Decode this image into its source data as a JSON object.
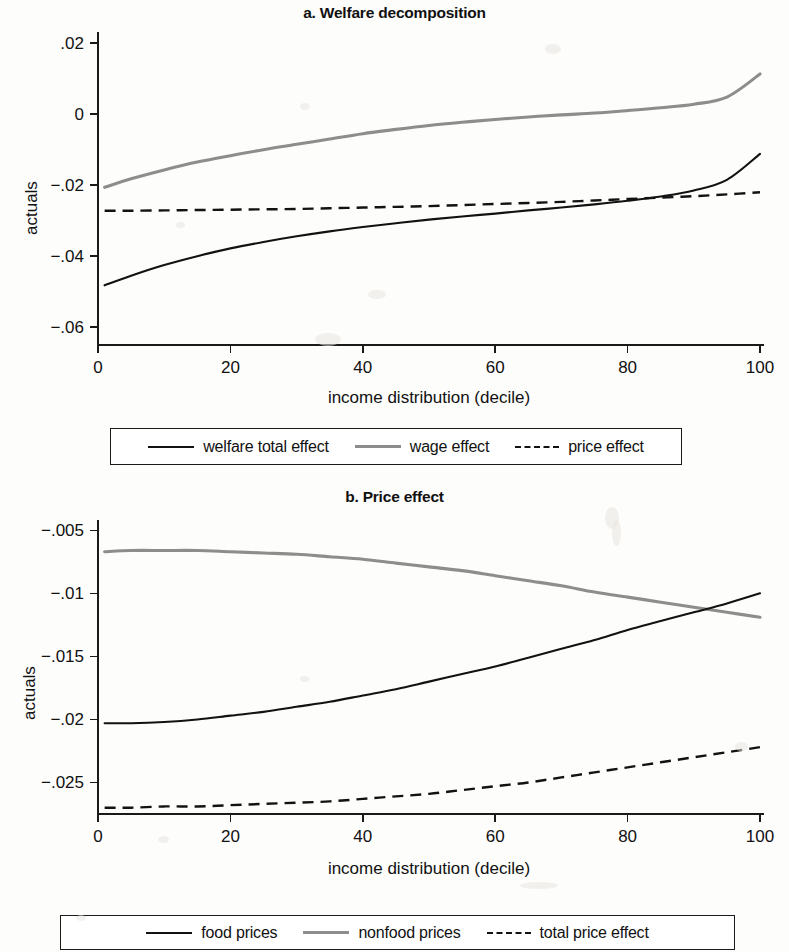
{
  "figure": {
    "background_color": "#fdfdfc",
    "line_color_solid": "#121212",
    "line_color_gray": "#8d8d8d"
  },
  "panel_a": {
    "title": "a. Welfare decomposition",
    "ylabel": "actuals",
    "xlabel": "income distribution (decile)",
    "y_ticks": [
      ".02",
      "0",
      "−.02",
      "−.04",
      "−.06"
    ],
    "x_ticks": [
      "0",
      "20",
      "40",
      "60",
      "80",
      "100"
    ],
    "legend": [
      {
        "label": "welfare total effect",
        "style": "solid",
        "color": "#121212"
      },
      {
        "label": "wage effect",
        "style": "solid",
        "color": "#8d8d8d"
      },
      {
        "label": "price effect",
        "style": "dashed",
        "color": "#121212"
      }
    ]
  },
  "panel_b": {
    "title": "b. Price effect",
    "ylabel": "actuals",
    "xlabel": "income distribution (decile)",
    "y_ticks": [
      "−.005",
      "−.01",
      "−.015",
      "−.02",
      "−.025"
    ],
    "x_ticks": [
      "0",
      "20",
      "40",
      "60",
      "80",
      "100"
    ],
    "legend": [
      {
        "label": "food prices",
        "style": "solid",
        "color": "#121212"
      },
      {
        "label": "nonfood prices",
        "style": "solid",
        "color": "#8d8d8d"
      },
      {
        "label": "total price effect",
        "style": "dashed",
        "color": "#121212"
      }
    ]
  },
  "chart_data": [
    {
      "type": "line",
      "title": "a. Welfare decomposition",
      "xlabel": "income distribution (decile)",
      "ylabel": "actuals",
      "xlim": [
        0,
        100
      ],
      "ylim": [
        -0.065,
        0.022
      ],
      "yticks": [
        0.02,
        0,
        -0.02,
        -0.04,
        -0.06
      ],
      "ytick_labels": [
        ".02",
        "0",
        "-.02",
        "-.04",
        "-.06"
      ],
      "xticks": [
        0,
        20,
        40,
        60,
        80,
        100
      ],
      "grid": false,
      "legend_position": "below",
      "x": [
        1,
        5,
        10,
        15,
        20,
        25,
        30,
        35,
        40,
        45,
        50,
        55,
        60,
        65,
        70,
        75,
        80,
        85,
        90,
        95,
        100
      ],
      "series": [
        {
          "name": "welfare total effect",
          "style": "solid",
          "color": "#121212",
          "values": [
            -0.0482,
            -0.0455,
            -0.0425,
            -0.04,
            -0.0378,
            -0.036,
            -0.0344,
            -0.033,
            -0.0318,
            -0.0307,
            -0.0297,
            -0.0288,
            -0.028,
            -0.0271,
            -0.0263,
            -0.0254,
            -0.0244,
            -0.0232,
            -0.0215,
            -0.0185,
            -0.0112
          ]
        },
        {
          "name": "wage effect",
          "style": "solid",
          "color": "#8d8d8d",
          "values": [
            -0.0206,
            -0.0182,
            -0.0157,
            -0.0135,
            -0.0117,
            -0.01,
            -0.0085,
            -0.007,
            -0.0055,
            -0.0043,
            -0.0032,
            -0.0023,
            -0.0015,
            -0.0008,
            -0.0002,
            0.0003,
            0.001,
            0.0018,
            0.0028,
            0.0048,
            0.0113
          ]
        },
        {
          "name": "price effect",
          "style": "dashed",
          "color": "#121212",
          "values": [
            -0.0272,
            -0.0272,
            -0.0271,
            -0.027,
            -0.0269,
            -0.0268,
            -0.0267,
            -0.0265,
            -0.0263,
            -0.0261,
            -0.0259,
            -0.0256,
            -0.0253,
            -0.025,
            -0.0247,
            -0.0243,
            -0.0239,
            -0.0235,
            -0.0231,
            -0.0226,
            -0.022
          ]
        }
      ]
    },
    {
      "type": "line",
      "title": "b. Price effect",
      "xlabel": "income distribution (decile)",
      "ylabel": "actuals",
      "xlim": [
        0,
        100
      ],
      "ylim": [
        -0.0275,
        -0.0045
      ],
      "yticks": [
        -0.005,
        -0.01,
        -0.015,
        -0.02,
        -0.025
      ],
      "ytick_labels": [
        "-.005",
        "-.01",
        "-.015",
        "-.02",
        "-.025"
      ],
      "xticks": [
        0,
        20,
        40,
        60,
        80,
        100
      ],
      "grid": false,
      "legend_position": "below",
      "x": [
        1,
        5,
        10,
        15,
        20,
        25,
        30,
        35,
        40,
        45,
        50,
        55,
        60,
        65,
        70,
        75,
        80,
        85,
        90,
        95,
        100
      ],
      "series": [
        {
          "name": "food prices",
          "style": "solid",
          "color": "#121212",
          "values": [
            -0.0203,
            -0.0203,
            -0.0202,
            -0.02,
            -0.0197,
            -0.0194,
            -0.019,
            -0.0186,
            -0.0181,
            -0.0176,
            -0.017,
            -0.0164,
            -0.0158,
            -0.0151,
            -0.0144,
            -0.0137,
            -0.0129,
            -0.0122,
            -0.0115,
            -0.0108,
            -0.01
          ]
        },
        {
          "name": "nonfood prices",
          "style": "solid",
          "color": "#8d8d8d",
          "values": [
            -0.0067,
            -0.0066,
            -0.0066,
            -0.0066,
            -0.0067,
            -0.0068,
            -0.0069,
            -0.0071,
            -0.0073,
            -0.0076,
            -0.0079,
            -0.0082,
            -0.0086,
            -0.009,
            -0.0094,
            -0.0099,
            -0.0103,
            -0.0107,
            -0.0111,
            -0.0115,
            -0.0119
          ]
        },
        {
          "name": "total price effect",
          "style": "dashed",
          "color": "#121212",
          "values": [
            -0.027,
            -0.027,
            -0.0269,
            -0.0269,
            -0.0268,
            -0.0267,
            -0.0266,
            -0.0265,
            -0.0263,
            -0.0261,
            -0.0259,
            -0.0256,
            -0.0253,
            -0.025,
            -0.0246,
            -0.0242,
            -0.0238,
            -0.0234,
            -0.023,
            -0.0226,
            -0.0222
          ]
        }
      ]
    }
  ]
}
